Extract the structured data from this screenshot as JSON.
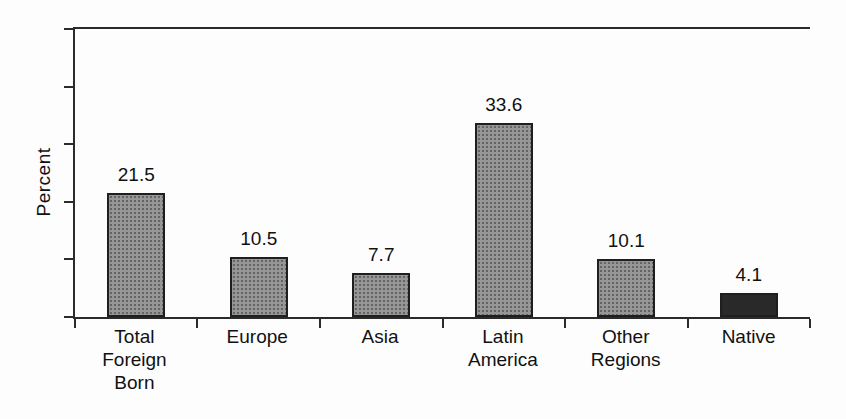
{
  "figure": {
    "background_color": "#fdfdfd",
    "axis_color": "#2b2b2b",
    "text_color": "#111111"
  },
  "chart_data": {
    "type": "bar",
    "title": "",
    "xlabel": "",
    "ylabel": "Percent",
    "categories": [
      "Total Foreign Born",
      "Europe",
      "Asia",
      "Latin America",
      "Other Regions",
      "Native"
    ],
    "category_label_lines": [
      [
        "Total",
        "Foreign",
        "Born"
      ],
      [
        "Europe"
      ],
      [
        "Asia"
      ],
      [
        "Latin",
        "America"
      ],
      [
        "Other",
        "Regions"
      ],
      [
        "Native"
      ]
    ],
    "values": [
      21.5,
      10.5,
      7.7,
      33.6,
      10.1,
      4.1
    ],
    "data_labels": [
      "21.5",
      "10.5",
      "7.7",
      "33.6",
      "10.1",
      "4.1"
    ],
    "bar_colors": [
      "#969696",
      "#969696",
      "#969696",
      "#969696",
      "#969696",
      "#2a2a2a"
    ],
    "bar_border_color": "#1f1f1f",
    "ylim": [
      0,
      50
    ],
    "ytick_step": 10,
    "yticks_labeled": false,
    "grid": false,
    "legend_position": "none",
    "data_labels_shown": true
  }
}
